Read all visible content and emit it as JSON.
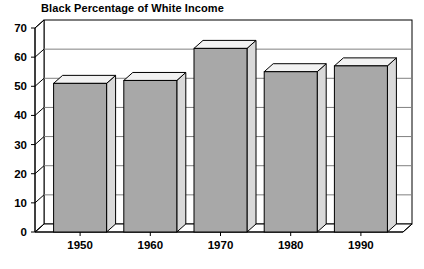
{
  "chart_data": {
    "type": "bar",
    "title": "Black Percentage of White Income",
    "xlabel": "",
    "ylabel": "",
    "categories": [
      "1950",
      "1960",
      "1970",
      "1980",
      "1990"
    ],
    "values": [
      51,
      52,
      63,
      55,
      57
    ],
    "ylim": [
      0,
      70
    ],
    "yticks": [
      0,
      10,
      20,
      30,
      40,
      50,
      60,
      70
    ],
    "ytick_labels": [
      "0",
      "10",
      "20",
      "30",
      "40",
      "50",
      "60",
      "70"
    ],
    "grid": true,
    "legend": false,
    "style": "3d-bar",
    "colors": {
      "bar_face": "#a8a8a8",
      "bar_top": "#f2f2f2",
      "bar_side": "#d9d9d9",
      "outline": "#000000",
      "grid": "#808080",
      "background": "#ffffff"
    }
  }
}
